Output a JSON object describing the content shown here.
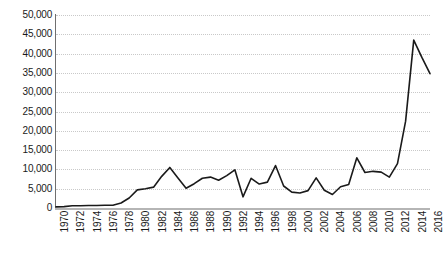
{
  "chart_data": {
    "type": "line",
    "title": "",
    "xlabel": "",
    "ylabel": "",
    "grid": true,
    "legend": false,
    "xlim": [
      1970,
      2016
    ],
    "ylim": [
      0,
      50000
    ],
    "y_ticks": [
      0,
      5000,
      10000,
      15000,
      20000,
      25000,
      30000,
      35000,
      40000,
      45000,
      50000
    ],
    "y_tick_labels": [
      "0",
      "5,000",
      "10,000",
      "15,000",
      "20,000",
      "25,000",
      "30,000",
      "35,000",
      "40,000",
      "45,000",
      "50,000"
    ],
    "x_tick_labels": [
      "1970",
      "1972",
      "1974",
      "1976",
      "1978",
      "1980",
      "1982",
      "1984",
      "1986",
      "1988",
      "1990",
      "1992",
      "1994",
      "1996",
      "1998",
      "2000",
      "2002",
      "2004",
      "2006",
      "2008",
      "2010",
      "2012",
      "2014",
      "2016"
    ],
    "x": [
      1970,
      1971,
      1972,
      1973,
      1974,
      1975,
      1976,
      1977,
      1978,
      1979,
      1980,
      1981,
      1982,
      1983,
      1984,
      1985,
      1986,
      1987,
      1988,
      1989,
      1990,
      1991,
      1992,
      1993,
      1994,
      1995,
      1996,
      1997,
      1998,
      1999,
      2000,
      2001,
      2002,
      2003,
      2004,
      2005,
      2006,
      2007,
      2008,
      2009,
      2010,
      2011,
      2012,
      2013,
      2014,
      2015,
      2016
    ],
    "values": [
      300,
      350,
      600,
      600,
      650,
      650,
      700,
      700,
      1300,
      2600,
      4700,
      5000,
      5400,
      8200,
      10500,
      7800,
      5100,
      6300,
      7700,
      8000,
      7200,
      8400,
      9900,
      2900,
      7700,
      6200,
      6700,
      11000,
      5700,
      4100,
      3900,
      4500,
      7800,
      4600,
      3500,
      5500,
      6100,
      13000,
      9200,
      9500,
      9300,
      8000,
      11500,
      22500,
      43500,
      39000,
      34800
    ],
    "line_color": "#1a1a1a",
    "line_width": 1.6,
    "background_color": "#ffffff",
    "grid_color": "#c9c9c9",
    "axis_color": "#6f6f6f"
  }
}
